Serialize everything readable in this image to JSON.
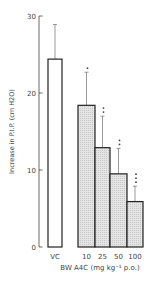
{
  "chart_data": {
    "type": "bar",
    "title": "",
    "ylabel": "Increase in P.I.P. (cm H2O)",
    "xlabel": "BW A4C (mg kg⁻¹ p.o.)",
    "ylim": [
      0,
      30
    ],
    "yticks": [
      0,
      10,
      20,
      30
    ],
    "grid": false,
    "categories": [
      "VC",
      "10",
      "25",
      "50",
      "100"
    ],
    "values": [
      24.4,
      18.4,
      12.9,
      9.5,
      5.9
    ],
    "error_upper": [
      28.9,
      22.7,
      17.0,
      12.8,
      7.9
    ],
    "significance": [
      "",
      "*",
      "**",
      "**",
      "***"
    ],
    "fills": [
      "open",
      "hatched",
      "hatched",
      "hatched",
      "hatched"
    ]
  },
  "colors": {
    "axis": "#444444",
    "bar_edge": "#222222",
    "open_fill": "#ffffff",
    "hatched_fill": "#d8d8d8"
  }
}
